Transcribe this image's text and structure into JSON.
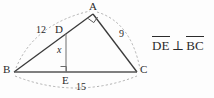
{
  "figure": {
    "name": "right-triangle-with-altitude",
    "background_color": "#fdfdfd",
    "stroke_color": "#3a3a3a",
    "dash_color": "#9a9a9a",
    "vertices": [
      {
        "id": "A",
        "label": "A",
        "x": 93,
        "y": 14
      },
      {
        "id": "B",
        "label": "B",
        "x": 14,
        "y": 72
      },
      {
        "id": "C",
        "label": "C",
        "x": 137,
        "y": 72
      },
      {
        "id": "D",
        "label": "D",
        "x": 62,
        "y": 33
      },
      {
        "id": "E",
        "label": "E",
        "x": 66,
        "y": 72
      }
    ],
    "segments": [
      {
        "name": "segment-BA",
        "from": "B",
        "to": "A"
      },
      {
        "name": "segment-AC",
        "from": "A",
        "to": "C"
      },
      {
        "name": "segment-BC",
        "from": "B",
        "to": "C"
      },
      {
        "name": "segment-DE",
        "from": "D",
        "to": "E"
      },
      {
        "name": "segment-BD-on-BA",
        "from": "B",
        "to": "D"
      }
    ],
    "right_angles": [
      {
        "name": "right-angle-at-A",
        "at": "A",
        "between": [
          "B",
          "C"
        ]
      },
      {
        "name": "right-angle-at-E",
        "at": "E",
        "between": [
          "D",
          "C"
        ]
      }
    ],
    "measures": [
      {
        "name": "measure-BA",
        "value": "12",
        "for": "BA",
        "x": 36,
        "y": 27
      },
      {
        "name": "measure-AC",
        "value": "9",
        "for": "AC",
        "x": 119,
        "y": 31
      },
      {
        "name": "measure-BC",
        "value": "15",
        "for": "BC",
        "x": 76,
        "y": 84
      },
      {
        "name": "measure-DE",
        "value": "x",
        "for": "DE",
        "x": 56,
        "y": 46
      }
    ],
    "arcs": [
      {
        "name": "arc-measure-BA",
        "from": "B",
        "to": "A",
        "side": "outer-left"
      },
      {
        "name": "arc-measure-AC",
        "from": "A",
        "to": "C",
        "side": "outer-right"
      },
      {
        "name": "arc-measure-BC",
        "from": "B",
        "to": "C",
        "side": "outer-bottom"
      }
    ]
  },
  "relation": {
    "name": "perpendicularity-statement",
    "first_segment": "DE",
    "symbol": "⊥",
    "second_segment": "BC",
    "full_text": "DE ⊥ BC"
  }
}
